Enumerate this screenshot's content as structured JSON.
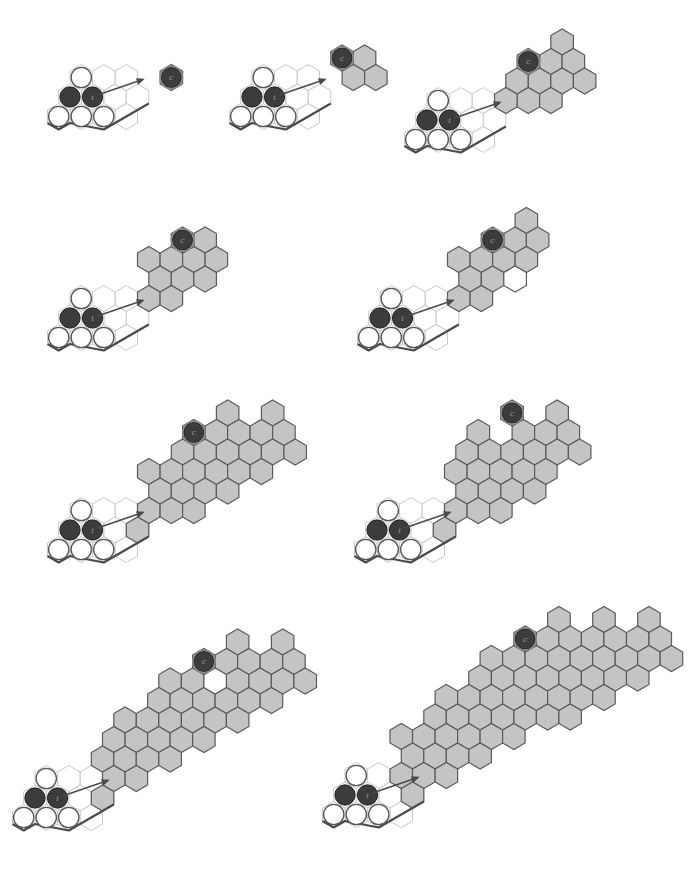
{
  "figure": {
    "hex_size": 13,
    "colors": {
      "background": "#ffffff",
      "shaded": "#c4c4c4",
      "shaded_stroke": "#5a5a5a",
      "empty_stroke": "#c8c8c8",
      "dark_stone": "#3c3c3c",
      "white_stone": "#ffffff"
    },
    "stone_labels": {
      "start": "i",
      "goal": "c"
    },
    "panels": [
      {
        "id": 1,
        "origin": [
          70,
          97
        ],
        "start": [
          1,
          0
        ],
        "corner": [
          0,
          0
        ],
        "whites": [
          [
            0,
            1
          ],
          [
            1,
            -1
          ],
          [
            0,
            -1
          ],
          [
            2,
            -1
          ]
        ],
        "empties": [
          [
            2,
            0
          ],
          [
            3,
            0
          ],
          [
            2,
            1
          ],
          [
            1,
            1
          ],
          [
            3,
            -1
          ]
        ],
        "goal": [
          4,
          1
        ],
        "shaded": [],
        "holes": [],
        "arrow": [
          [
            1,
            0
          ],
          [
            3,
            1
          ]
        ]
      },
      {
        "id": 2,
        "origin": [
          252,
          97
        ],
        "start": [
          1,
          0
        ],
        "corner": [
          0,
          0
        ],
        "whites": [
          [
            0,
            1
          ],
          [
            1,
            -1
          ],
          [
            0,
            -1
          ],
          [
            2,
            -1
          ]
        ],
        "empties": [
          [
            2,
            0
          ],
          [
            3,
            0
          ],
          [
            2,
            1
          ],
          [
            1,
            1
          ],
          [
            3,
            -1
          ]
        ],
        "goal": [
          3,
          2
        ],
        "shaded": [
          [
            4,
            2
          ],
          [
            4,
            1
          ],
          [
            5,
            1
          ]
        ],
        "holes": [],
        "arrow": [
          [
            1,
            0
          ],
          [
            3,
            1
          ]
        ]
      },
      {
        "id": 3,
        "origin": [
          427,
          120
        ],
        "start": [
          1,
          0
        ],
        "corner": [
          0,
          0
        ],
        "whites": [
          [
            0,
            1
          ],
          [
            1,
            -1
          ],
          [
            0,
            -1
          ],
          [
            2,
            -1
          ]
        ],
        "empties": [
          [
            2,
            0
          ],
          [
            3,
            0
          ],
          [
            2,
            1
          ],
          [
            1,
            1
          ],
          [
            3,
            -1
          ]
        ],
        "goal": [
          3,
          3
        ],
        "shaded": [
          [
            4,
            4
          ],
          [
            4,
            3
          ],
          [
            5,
            3
          ],
          [
            3,
            2
          ],
          [
            4,
            2
          ],
          [
            5,
            2
          ],
          [
            6,
            2
          ],
          [
            4,
            1
          ],
          [
            5,
            1
          ],
          [
            3,
            1
          ]
        ],
        "holes": [],
        "arrow": [
          [
            1,
            0
          ],
          [
            3,
            1
          ]
        ]
      },
      {
        "id": 4,
        "origin": [
          70,
          318
        ],
        "start": [
          1,
          0
        ],
        "corner": [
          0,
          0
        ],
        "whites": [
          [
            0,
            1
          ],
          [
            1,
            -1
          ],
          [
            0,
            -1
          ],
          [
            2,
            -1
          ]
        ],
        "empties": [
          [
            2,
            0
          ],
          [
            3,
            0
          ],
          [
            2,
            1
          ],
          [
            1,
            1
          ],
          [
            3,
            -1
          ]
        ],
        "goal": [
          3,
          4
        ],
        "shaded": [
          [
            4,
            4
          ],
          [
            2,
            3
          ],
          [
            3,
            3
          ],
          [
            4,
            3
          ],
          [
            5,
            3
          ],
          [
            3,
            2
          ],
          [
            4,
            2
          ],
          [
            5,
            2
          ],
          [
            3,
            1
          ],
          [
            4,
            1
          ]
        ],
        "holes": [],
        "arrow": [
          [
            1,
            0
          ],
          [
            3,
            1
          ]
        ]
      },
      {
        "id": 5,
        "origin": [
          380,
          318
        ],
        "start": [
          1,
          0
        ],
        "corner": [
          0,
          0
        ],
        "whites": [
          [
            0,
            1
          ],
          [
            1,
            -1
          ],
          [
            0,
            -1
          ],
          [
            2,
            -1
          ]
        ],
        "empties": [
          [
            2,
            0
          ],
          [
            3,
            0
          ],
          [
            2,
            1
          ],
          [
            1,
            1
          ],
          [
            3,
            -1
          ]
        ],
        "goal": [
          3,
          4
        ],
        "shaded": [
          [
            4,
            5
          ],
          [
            4,
            4
          ],
          [
            5,
            4
          ],
          [
            2,
            3
          ],
          [
            3,
            3
          ],
          [
            4,
            3
          ],
          [
            5,
            3
          ],
          [
            3,
            2
          ],
          [
            4,
            2
          ],
          [
            3,
            1
          ],
          [
            4,
            1
          ]
        ],
        "holes": [
          [
            5,
            2
          ]
        ],
        "arrow": [
          [
            1,
            0
          ],
          [
            3,
            1
          ]
        ]
      },
      {
        "id": 6,
        "origin": [
          70,
          530
        ],
        "start": [
          1,
          0
        ],
        "corner": [
          0,
          0
        ],
        "whites": [
          [
            0,
            1
          ],
          [
            1,
            -1
          ],
          [
            0,
            -1
          ],
          [
            2,
            -1
          ]
        ],
        "empties": [
          [
            2,
            0
          ],
          [
            3,
            0
          ],
          [
            2,
            1
          ],
          [
            1,
            1
          ],
          [
            3,
            -1
          ]
        ],
        "goal": [
          3,
          5
        ],
        "shaded": [
          [
            4,
            6
          ],
          [
            6,
            6
          ],
          [
            4,
            5
          ],
          [
            5,
            5
          ],
          [
            6,
            5
          ],
          [
            7,
            5
          ],
          [
            3,
            4
          ],
          [
            4,
            4
          ],
          [
            5,
            4
          ],
          [
            6,
            4
          ],
          [
            7,
            4
          ],
          [
            8,
            4
          ],
          [
            2,
            3
          ],
          [
            3,
            3
          ],
          [
            4,
            3
          ],
          [
            5,
            3
          ],
          [
            6,
            3
          ],
          [
            7,
            3
          ],
          [
            3,
            2
          ],
          [
            4,
            2
          ],
          [
            5,
            2
          ],
          [
            6,
            2
          ],
          [
            3,
            1
          ],
          [
            4,
            1
          ],
          [
            5,
            1
          ],
          [
            3,
            0
          ]
        ],
        "holes": [],
        "arrow": [
          [
            1,
            0
          ],
          [
            3,
            1
          ]
        ]
      },
      {
        "id": 7,
        "origin": [
          377,
          530
        ],
        "start": [
          1,
          0
        ],
        "corner": [
          0,
          0
        ],
        "whites": [
          [
            0,
            1
          ],
          [
            1,
            -1
          ],
          [
            0,
            -1
          ],
          [
            2,
            -1
          ]
        ],
        "empties": [
          [
            2,
            0
          ],
          [
            3,
            0
          ],
          [
            2,
            1
          ],
          [
            1,
            1
          ],
          [
            3,
            -1
          ]
        ],
        "goal": [
          3,
          6
        ],
        "shaded": [
          [
            5,
            6
          ],
          [
            2,
            5
          ],
          [
            4,
            5
          ],
          [
            5,
            5
          ],
          [
            6,
            5
          ],
          [
            2,
            4
          ],
          [
            3,
            4
          ],
          [
            4,
            4
          ],
          [
            5,
            4
          ],
          [
            6,
            4
          ],
          [
            7,
            4
          ],
          [
            2,
            3
          ],
          [
            3,
            3
          ],
          [
            4,
            3
          ],
          [
            5,
            3
          ],
          [
            6,
            3
          ],
          [
            3,
            2
          ],
          [
            4,
            2
          ],
          [
            5,
            2
          ],
          [
            6,
            2
          ],
          [
            3,
            1
          ],
          [
            4,
            1
          ],
          [
            5,
            1
          ],
          [
            3,
            0
          ]
        ],
        "holes": [],
        "arrow": [
          [
            1,
            0
          ],
          [
            3,
            1
          ]
        ]
      },
      {
        "id": 8,
        "origin": [
          35,
          798
        ],
        "start": [
          1,
          0
        ],
        "corner": [
          0,
          0
        ],
        "whites": [
          [
            0,
            1
          ],
          [
            1,
            -1
          ],
          [
            0,
            -1
          ],
          [
            2,
            -1
          ]
        ],
        "empties": [
          [
            2,
            0
          ],
          [
            3,
            0
          ],
          [
            2,
            1
          ],
          [
            1,
            1
          ],
          [
            3,
            -1
          ]
        ],
        "goal": [
          4,
          7
        ],
        "shaded": [
          [
            5,
            8
          ],
          [
            7,
            8
          ],
          [
            5,
            7
          ],
          [
            6,
            7
          ],
          [
            7,
            7
          ],
          [
            8,
            7
          ],
          [
            3,
            6
          ],
          [
            4,
            6
          ],
          [
            6,
            6
          ],
          [
            7,
            6
          ],
          [
            8,
            6
          ],
          [
            9,
            6
          ],
          [
            3,
            5
          ],
          [
            4,
            5
          ],
          [
            5,
            5
          ],
          [
            6,
            5
          ],
          [
            7,
            5
          ],
          [
            8,
            5
          ],
          [
            2,
            4
          ],
          [
            3,
            4
          ],
          [
            4,
            4
          ],
          [
            5,
            4
          ],
          [
            6,
            4
          ],
          [
            7,
            4
          ],
          [
            2,
            3
          ],
          [
            3,
            3
          ],
          [
            4,
            3
          ],
          [
            5,
            3
          ],
          [
            6,
            3
          ],
          [
            2,
            2
          ],
          [
            3,
            2
          ],
          [
            4,
            2
          ],
          [
            5,
            2
          ],
          [
            3,
            1
          ],
          [
            4,
            1
          ],
          [
            3,
            0
          ]
        ],
        "holes": [
          [
            5,
            6
          ]
        ],
        "arrow": [
          [
            1,
            0
          ],
          [
            3,
            1
          ]
        ]
      },
      {
        "id": 9,
        "origin": [
          345,
          795
        ],
        "start": [
          1,
          0
        ],
        "corner": [
          0,
          0
        ],
        "whites": [
          [
            0,
            1
          ],
          [
            1,
            -1
          ],
          [
            0,
            -1
          ],
          [
            2,
            -1
          ]
        ],
        "empties": [
          [
            2,
            0
          ],
          [
            3,
            0
          ],
          [
            2,
            1
          ],
          [
            1,
            1
          ],
          [
            3,
            -1
          ]
        ],
        "goal": [
          4,
          8
        ],
        "shaded": [
          [
            5,
            9
          ],
          [
            7,
            9
          ],
          [
            9,
            9
          ],
          [
            5,
            8
          ],
          [
            6,
            8
          ],
          [
            7,
            8
          ],
          [
            8,
            8
          ],
          [
            9,
            8
          ],
          [
            10,
            8
          ],
          [
            3,
            7
          ],
          [
            4,
            7
          ],
          [
            5,
            7
          ],
          [
            6,
            7
          ],
          [
            7,
            7
          ],
          [
            8,
            7
          ],
          [
            9,
            7
          ],
          [
            10,
            7
          ],
          [
            11,
            7
          ],
          [
            3,
            6
          ],
          [
            4,
            6
          ],
          [
            5,
            6
          ],
          [
            6,
            6
          ],
          [
            7,
            6
          ],
          [
            8,
            6
          ],
          [
            9,
            6
          ],
          [
            10,
            6
          ],
          [
            2,
            5
          ],
          [
            3,
            5
          ],
          [
            4,
            5
          ],
          [
            5,
            5
          ],
          [
            6,
            5
          ],
          [
            7,
            5
          ],
          [
            8,
            5
          ],
          [
            9,
            5
          ],
          [
            2,
            4
          ],
          [
            3,
            4
          ],
          [
            4,
            4
          ],
          [
            5,
            4
          ],
          [
            6,
            4
          ],
          [
            7,
            4
          ],
          [
            8,
            4
          ],
          [
            1,
            3
          ],
          [
            2,
            3
          ],
          [
            3,
            3
          ],
          [
            4,
            3
          ],
          [
            5,
            3
          ],
          [
            6,
            3
          ],
          [
            2,
            2
          ],
          [
            3,
            2
          ],
          [
            4,
            2
          ],
          [
            5,
            2
          ],
          [
            2,
            1
          ],
          [
            3,
            1
          ],
          [
            4,
            1
          ],
          [
            3,
            0
          ]
        ],
        "holes": [],
        "arrow": [
          [
            1,
            0
          ],
          [
            3,
            1
          ]
        ]
      }
    ]
  }
}
